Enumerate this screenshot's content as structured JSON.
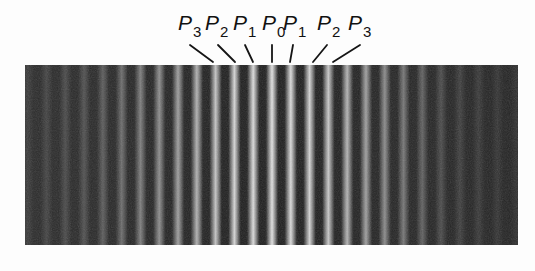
{
  "figure": {
    "background_color": "#fdfdfd",
    "band": {
      "x": 25,
      "y": 65,
      "width": 493,
      "height": 180,
      "fringe_period_px": 18.8,
      "center_bright_fringe_x": 272,
      "bright_color": "#dcdcdc",
      "dark_color": "#1c1c1c"
    },
    "labels": [
      {
        "letter": "P",
        "sub": "3",
        "x": 178,
        "line": [
          190,
          45,
          213,
          62
        ]
      },
      {
        "letter": "P",
        "sub": "2",
        "x": 205,
        "line": [
          218,
          45,
          235,
          62
        ]
      },
      {
        "letter": "P",
        "sub": "1",
        "x": 233,
        "line": [
          245,
          45,
          253,
          62
        ]
      },
      {
        "letter": "P",
        "sub": "0",
        "x": 262,
        "line": [
          272,
          45,
          272,
          62
        ]
      },
      {
        "letter": "P",
        "sub": "1",
        "x": 283,
        "line": [
          293,
          45,
          290,
          62
        ]
      },
      {
        "letter": "P",
        "sub": "2",
        "x": 317,
        "line": [
          327,
          45,
          313,
          62
        ]
      },
      {
        "letter": "P",
        "sub": "3",
        "x": 348,
        "line": [
          360,
          45,
          333,
          62
        ]
      }
    ]
  }
}
